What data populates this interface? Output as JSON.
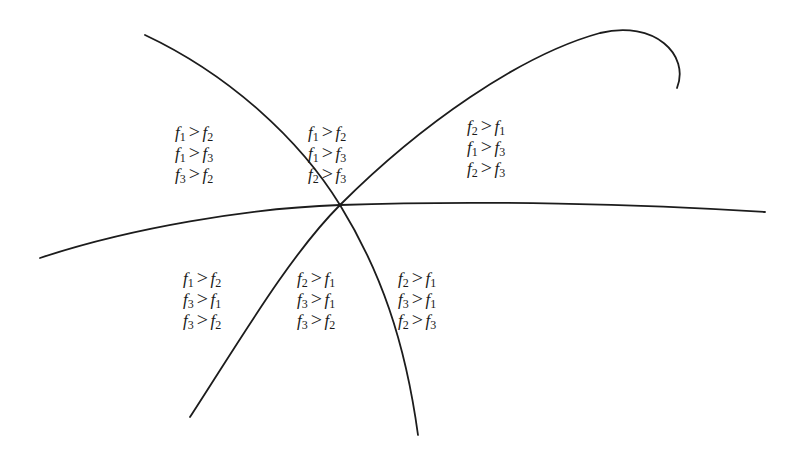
{
  "diagram": {
    "type": "region-partition",
    "stroke_color": "#1c1c1c",
    "background_color": "#ffffff",
    "intersection_point": [
      340,
      205
    ],
    "curves": [
      {
        "name": "curve-a",
        "from": [
          145,
          35
        ],
        "through": [
          340,
          205
        ],
        "to": [
          418,
          435
        ]
      },
      {
        "name": "curve-b",
        "from": [
          190,
          417
        ],
        "through": [
          340,
          205
        ],
        "to": [
          677,
          88
        ],
        "note": "hooks downward at upper-right end"
      },
      {
        "name": "curve-c",
        "from": [
          40,
          258
        ],
        "through": [
          340,
          205
        ],
        "to": [
          765,
          212
        ]
      }
    ],
    "regions": [
      {
        "name": "upper-left",
        "position": [
          175,
          122
        ],
        "relations": [
          {
            "left": "f",
            "left_sub": "1",
            "op": ">",
            "right": "f",
            "right_sub": "2"
          },
          {
            "left": "f",
            "left_sub": "1",
            "op": ">",
            "right": "f",
            "right_sub": "3"
          },
          {
            "left": "f",
            "left_sub": "3",
            "op": ">",
            "right": "f",
            "right_sub": "2"
          }
        ]
      },
      {
        "name": "upper-middle",
        "position": [
          308,
          122
        ],
        "relations": [
          {
            "left": "f",
            "left_sub": "1",
            "op": ">",
            "right": "f",
            "right_sub": "2"
          },
          {
            "left": "f",
            "left_sub": "1",
            "op": ">",
            "right": "f",
            "right_sub": "3"
          },
          {
            "left": "f",
            "left_sub": "2",
            "op": ">",
            "right": "f",
            "right_sub": "3"
          }
        ]
      },
      {
        "name": "upper-right",
        "position": [
          467,
          116
        ],
        "relations": [
          {
            "left": "f",
            "left_sub": "2",
            "op": ">",
            "right": "f",
            "right_sub": "1"
          },
          {
            "left": "f",
            "left_sub": "1",
            "op": ">",
            "right": "f",
            "right_sub": "3"
          },
          {
            "left": "f",
            "left_sub": "2",
            "op": ">",
            "right": "f",
            "right_sub": "3"
          }
        ]
      },
      {
        "name": "lower-left",
        "position": [
          183,
          268
        ],
        "relations": [
          {
            "left": "f",
            "left_sub": "1",
            "op": ">",
            "right": "f",
            "right_sub": "2"
          },
          {
            "left": "f",
            "left_sub": "3",
            "op": ">",
            "right": "f",
            "right_sub": "1"
          },
          {
            "left": "f",
            "left_sub": "3",
            "op": ">",
            "right": "f",
            "right_sub": "2"
          }
        ]
      },
      {
        "name": "lower-middle",
        "position": [
          297,
          268
        ],
        "relations": [
          {
            "left": "f",
            "left_sub": "2",
            "op": ">",
            "right": "f",
            "right_sub": "1"
          },
          {
            "left": "f",
            "left_sub": "3",
            "op": ">",
            "right": "f",
            "right_sub": "1"
          },
          {
            "left": "f",
            "left_sub": "3",
            "op": ">",
            "right": "f",
            "right_sub": "2"
          }
        ]
      },
      {
        "name": "lower-right",
        "position": [
          398,
          268
        ],
        "relations": [
          {
            "left": "f",
            "left_sub": "2",
            "op": ">",
            "right": "f",
            "right_sub": "1"
          },
          {
            "left": "f",
            "left_sub": "3",
            "op": ">",
            "right": "f",
            "right_sub": "1"
          },
          {
            "left": "f",
            "left_sub": "2",
            "op": ">",
            "right": "f",
            "right_sub": "3"
          }
        ]
      }
    ]
  }
}
